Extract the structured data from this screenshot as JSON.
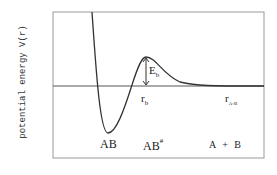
{
  "diagram": {
    "y_axis_label": "potential energy V(r)",
    "labels": {
      "barrier_energy": {
        "main": "E",
        "sub": "b"
      },
      "barrier_position": {
        "main": "r",
        "sub": "b"
      },
      "separation": {
        "main": "r",
        "sub": "A-B"
      },
      "bound_state": "AB",
      "transition_state": {
        "main": "AB",
        "sup": "#"
      },
      "separated": "A + B"
    },
    "colors": {
      "curve": "#333333",
      "frame": "#999999",
      "baseline": "#555555"
    }
  }
}
